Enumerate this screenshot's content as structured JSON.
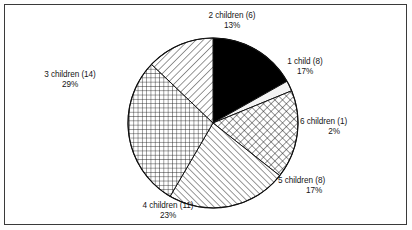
{
  "figure": {
    "background_color": "#ffffff",
    "border_color": "#3a3a3a",
    "text_color": "#151515"
  },
  "chart_data": {
    "type": "pie",
    "title": "",
    "subtitle": "",
    "xlabel": "",
    "ylabel": "",
    "legend_position": "none",
    "grid": false,
    "total_count": 48,
    "start_angle_deg": 0,
    "direction": "clockwise",
    "categories": [
      "1 child",
      "6 children",
      "5 children",
      "4 children",
      "3 children",
      "2 children"
    ],
    "counts": [
      8,
      1,
      8,
      11,
      14,
      6
    ],
    "values": [
      17,
      2,
      17,
      23,
      29,
      13
    ],
    "slices": [
      {
        "key": "one-child",
        "category": "1 child",
        "count": 8,
        "percent": 17,
        "label_line1": "1 child (8)",
        "label_line2": "17%",
        "fill": "solid-black",
        "fill_color": "#000000"
      },
      {
        "key": "six-children",
        "category": "6 children",
        "count": 1,
        "percent": 2,
        "label_line1": "6 children (1)",
        "label_line2": "2%",
        "fill": "solid-white",
        "fill_color": "#f2f2f2"
      },
      {
        "key": "five-children",
        "category": "5 children",
        "count": 8,
        "percent": 17,
        "label_line1": "5 children (8)",
        "label_line2": "17%",
        "fill": "diagonal-crosshatch",
        "fill_color": "#ffffff"
      },
      {
        "key": "four-children",
        "category": "4 children",
        "count": 11,
        "percent": 23,
        "label_line1": "4 children (11)",
        "label_line2": "23%",
        "fill": "diagonal-hatch-backward",
        "fill_color": "#ffffff"
      },
      {
        "key": "three-children",
        "category": "3 children",
        "count": 14,
        "percent": 29,
        "label_line1": "3 children (14)",
        "label_line2": "29%",
        "fill": "square-grid",
        "fill_color": "#ffffff"
      },
      {
        "key": "two-children",
        "category": "2 children",
        "count": 6,
        "percent": 13,
        "label_line1": "2 children (6)",
        "label_line2": "13%",
        "fill": "diagonal-hatch-forward",
        "fill_color": "#ffffff"
      }
    ]
  }
}
